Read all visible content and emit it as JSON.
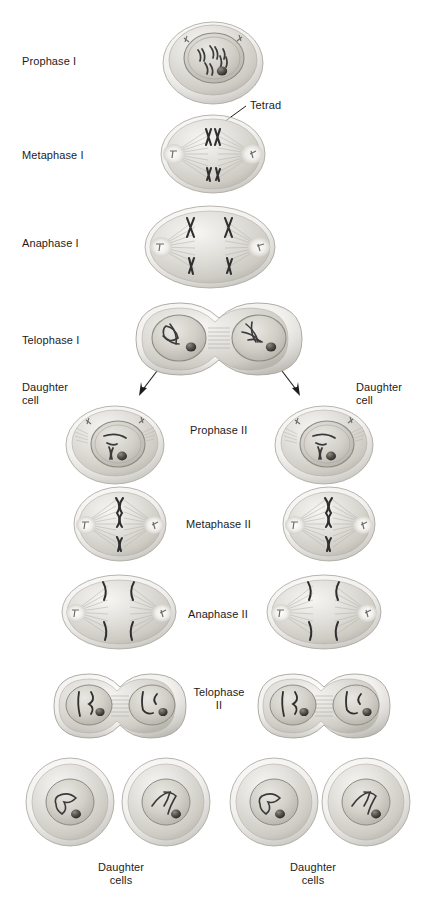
{
  "figure": {
    "background_color": "#ffffff",
    "ink_color": "#1c1c1c",
    "cell_fill": "#d9d7d2",
    "cell_fill_light": "#efeeeb",
    "cell_edge": "#9a978f",
    "nucleus_fill": "#c9c6c0",
    "chromosome_color": "#3a3a3a",
    "nucleolus_color": "#4a4a4a"
  },
  "labels": {
    "prophase_1": "Prophase I",
    "metaphase_1": "Metaphase I",
    "anaphase_1": "Anaphase I",
    "telophase_1": "Telophase I",
    "tetrad": "Tetrad",
    "daughter_cell_left": "Daughter\ncell",
    "daughter_cell_right": "Daughter\ncell",
    "prophase_2": "Prophase II",
    "metaphase_2": "Metaphase II",
    "anaphase_2": "Anaphase II",
    "telophase_2": "Telophase\nII",
    "daughter_cells_left": "Daughter\ncells",
    "daughter_cells_right": "Daughter\ncells"
  },
  "stages": [
    {
      "id": "prophase-1",
      "label": "Prophase I",
      "label_x": 22,
      "label_y": 55,
      "cells": 1,
      "phase": "I"
    },
    {
      "id": "metaphase-1",
      "label": "Metaphase I",
      "label_x": 22,
      "label_y": 149,
      "cells": 1,
      "phase": "I"
    },
    {
      "id": "anaphase-1",
      "label": "Anaphase I",
      "label_x": 22,
      "label_y": 237,
      "cells": 1,
      "phase": "I"
    },
    {
      "id": "telophase-1",
      "label": "Telophase I",
      "label_x": 22,
      "label_y": 334,
      "cells": 1,
      "phase": "I"
    },
    {
      "id": "prophase-2",
      "label": "Prophase II",
      "label_x": 190,
      "label_y": 424,
      "cells": 2,
      "phase": "II"
    },
    {
      "id": "metaphase-2",
      "label": "Metaphase II",
      "label_x": 186,
      "label_y": 518,
      "cells": 2,
      "phase": "II"
    },
    {
      "id": "anaphase-2",
      "label": "Anaphase II",
      "label_x": 188,
      "label_y": 608,
      "cells": 2,
      "phase": "II"
    },
    {
      "id": "telophase-2",
      "label": "Telophase\nII",
      "label_x": 196,
      "label_y": 686,
      "cells": 2,
      "phase": "II"
    }
  ],
  "annotations": [
    {
      "id": "tetrad-callout",
      "text": "Tetrad",
      "x": 250,
      "y": 99
    },
    {
      "id": "daughter-cell-left-callout",
      "text": "Daughter\ncell",
      "x": 22,
      "y": 381
    },
    {
      "id": "daughter-cell-right-callout",
      "text": "Daughter\ncell",
      "x": 356,
      "y": 381
    },
    {
      "id": "daughter-cells-left-callout",
      "text": "Daughter\ncells",
      "x": 98,
      "y": 861
    },
    {
      "id": "daughter-cells-right-callout",
      "text": "Daughter\ncells",
      "x": 290,
      "y": 861
    }
  ]
}
